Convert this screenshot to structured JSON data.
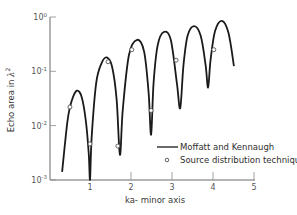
{
  "chart_data": {
    "type": "line",
    "title": "",
    "xlabel": "ka- minor axis",
    "ylabel": "Echo area in λ²",
    "ylabel_parts": {
      "text": "Echo area in ",
      "symbol": "λ",
      "sup": "2"
    },
    "yscale": "log",
    "xlim": [
      0,
      5
    ],
    "ylim": [
      0.001,
      1
    ],
    "grid": false,
    "legend_position": "lower right, inside plot",
    "x_ticks": [
      1,
      2,
      3,
      4,
      5
    ],
    "x_tick_labels": [
      "1",
      "2",
      "3",
      "4",
      "5"
    ],
    "y_ticks": [
      0.001,
      0.01,
      0.1,
      1
    ],
    "y_tick_labels": [
      {
        "base": "10",
        "exp": "-3"
      },
      {
        "base": "10",
        "exp": "-2"
      },
      {
        "base": "10",
        "exp": "-1"
      },
      {
        "base": "10",
        "exp": "0"
      }
    ],
    "series": [
      {
        "name": "Moffatt and Kennaugh",
        "style": "solid line",
        "color": "#1a1a1a",
        "x": [
          0.32,
          0.45,
          0.55,
          0.68,
          0.8,
          0.9,
          0.97,
          1.0,
          1.04,
          1.15,
          1.28,
          1.41,
          1.54,
          1.65,
          1.73,
          1.8,
          1.95,
          2.15,
          2.32,
          2.43,
          2.49,
          2.55,
          2.65,
          2.8,
          2.97,
          3.12,
          3.2,
          3.28,
          3.38,
          3.54,
          3.7,
          3.82,
          3.88,
          3.94,
          4.05,
          4.22,
          4.38,
          4.51
        ],
        "y": [
          0.0014,
          0.012,
          0.028,
          0.044,
          0.033,
          0.012,
          0.003,
          0.001,
          0.006,
          0.06,
          0.14,
          0.18,
          0.12,
          0.03,
          0.0029,
          0.02,
          0.2,
          0.38,
          0.23,
          0.04,
          0.0068,
          0.06,
          0.3,
          0.53,
          0.38,
          0.06,
          0.021,
          0.13,
          0.45,
          0.68,
          0.45,
          0.13,
          0.05,
          0.16,
          0.55,
          0.85,
          0.5,
          0.125
        ]
      },
      {
        "name": "Source distribution technique",
        "style": "open circle markers",
        "color": "#1a1a1a",
        "x": [
          0.51,
          1.0,
          1.44,
          1.68,
          2.02,
          2.49,
          3.1,
          4.02
        ],
        "y": [
          0.022,
          0.0046,
          0.15,
          0.0042,
          0.25,
          0.019,
          0.16,
          0.25
        ]
      }
    ],
    "legend": [
      {
        "label": "Moffatt and Kennaugh",
        "marker": "line"
      },
      {
        "label": "Source distribution technique",
        "marker": "circle"
      }
    ]
  }
}
